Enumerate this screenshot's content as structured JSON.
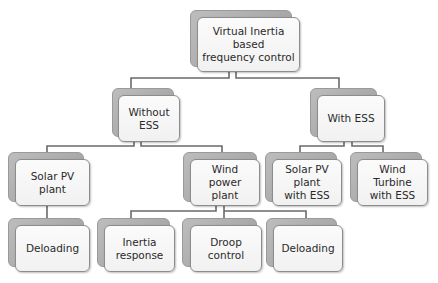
{
  "diagram": {
    "type": "hierarchy",
    "root": {
      "label": "Virtual Inertia based frequency control",
      "line1": "Virtual Inertia based",
      "line2": "frequency control"
    },
    "level1": [
      {
        "label": "Without ESS"
      },
      {
        "label": "With ESS"
      }
    ],
    "without_ess_children": [
      {
        "label": "Solar PV plant"
      },
      {
        "label": "Wind power plant",
        "line1": "Wind power",
        "line2": "plant"
      }
    ],
    "with_ess_children": [
      {
        "label": "Solar PV plant with ESS",
        "line1": "Solar PV plant",
        "line2": "with ESS"
      },
      {
        "label": "Wind Turbine with ESS",
        "line1": "Wind Turbine",
        "line2": "with ESS"
      }
    ],
    "solar_children": [
      {
        "label": "Deloading"
      }
    ],
    "wind_children": [
      {
        "label": "Inertia response",
        "line1": "Inertia",
        "line2": "response"
      },
      {
        "label": "Droop control"
      },
      {
        "label": "Deloading"
      }
    ],
    "edges": [
      [
        "Virtual Inertia based frequency control",
        "Without ESS"
      ],
      [
        "Virtual Inertia based frequency control",
        "With ESS"
      ],
      [
        "Without ESS",
        "Solar PV plant"
      ],
      [
        "Without ESS",
        "Wind power plant"
      ],
      [
        "With ESS",
        "Solar PV plant with ESS"
      ],
      [
        "With ESS",
        "Wind Turbine with ESS"
      ],
      [
        "Solar PV plant",
        "Deloading"
      ],
      [
        "Wind power plant",
        "Inertia response"
      ],
      [
        "Wind power plant",
        "Droop control"
      ],
      [
        "Wind power plant",
        "Deloading"
      ]
    ],
    "colors": {
      "box_front": "#f4f4f4",
      "box_back": "#a9a9a9",
      "connector": "#6a6a6a",
      "text": "#2a2a2a"
    }
  }
}
